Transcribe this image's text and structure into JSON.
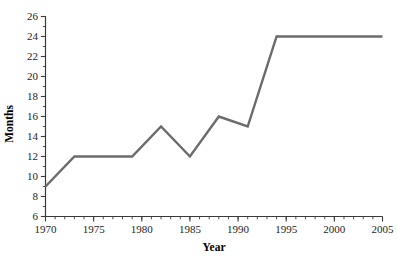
{
  "chart_data": {
    "type": "line",
    "title": "",
    "subtitle": "",
    "xlabel": "Year",
    "ylabel": "Months",
    "xlim": [
      1970,
      2005
    ],
    "ylim": [
      6,
      26
    ],
    "grid": false,
    "legend": false,
    "legend_position": "none",
    "line_color": "#6b6b6b",
    "axis_color": "#3a3a3a",
    "x_major_ticks": [
      1970,
      1975,
      1980,
      1985,
      1990,
      1995,
      2000,
      2005
    ],
    "x_major_tick_labels": [
      "1970",
      "1975",
      "1980",
      "1985",
      "1990",
      "1995",
      "2000",
      "2005"
    ],
    "x_minor_tick_step": 1,
    "y_major_ticks": [
      6,
      8,
      10,
      12,
      14,
      16,
      18,
      20,
      22,
      24,
      26
    ],
    "y_major_tick_labels": [
      "6",
      "8",
      "10",
      "12",
      "14",
      "16",
      "18",
      "20",
      "22",
      "24",
      "26"
    ],
    "y_minor_tick_step": 1,
    "series": [
      {
        "name": "Months",
        "x": [
          1970,
          1973,
          1979,
          1982,
          1985,
          1988,
          1991,
          1994,
          2005
        ],
        "values": [
          9,
          12,
          12,
          15,
          12,
          16,
          15,
          24,
          24
        ]
      }
    ]
  },
  "axis_titles": {
    "x": "Year",
    "y": "Months"
  }
}
